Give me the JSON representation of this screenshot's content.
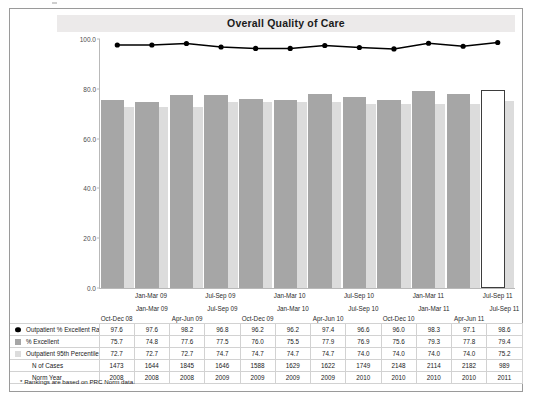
{
  "chart_data": {
    "type": "bar",
    "title": "Overall Quality of Care",
    "xlabel": "",
    "ylabel": "",
    "ylim": [
      0.0,
      100.0
    ],
    "yticks": [
      "0.0",
      "20.0",
      "40.0",
      "60.0",
      "80.0",
      "100.0"
    ],
    "grid": false,
    "legend_position": "table-left",
    "categories": [
      "Oct-Dec 08",
      "Jan-Mar 09",
      "Apr-Jun 09",
      "Jul-Sep 09",
      "Oct-Dec 09",
      "Jan-Mar 10",
      "Apr-Jun 10",
      "Jul-Sep 10",
      "Oct-Dec 10",
      "Jan-Mar 11",
      "Apr-Jun 11",
      "Jul-Sep 11"
    ],
    "series": [
      {
        "name": "Outpatient % Excellent Rank *",
        "type": "line",
        "color": "#000000",
        "values": [
          97.6,
          97.6,
          98.2,
          96.8,
          96.2,
          96.2,
          97.4,
          96.6,
          96.0,
          98.3,
          97.1,
          98.6
        ]
      },
      {
        "name": "% Excellent",
        "type": "bar",
        "color": "#a6a6a6",
        "values": [
          75.7,
          74.8,
          77.6,
          77.5,
          76.0,
          75.5,
          77.9,
          76.9,
          75.6,
          79.3,
          77.8,
          79.4
        ]
      },
      {
        "name": "Outpatient 95th Percentile",
        "type": "bar",
        "color": "#dcdcdc",
        "values": [
          72.7,
          72.7,
          72.7,
          74.7,
          74.7,
          74.7,
          74.7,
          74.0,
          74.0,
          74.0,
          74.0,
          75.2
        ]
      }
    ],
    "highlight_index": 11,
    "footnote": "* Rankings are based on PRC Norm data."
  },
  "chart": {
    "title": "Overall Quality of Care",
    "yticks": [
      "100.0",
      "80.0",
      "60.0",
      "40.0",
      "20.0",
      "0.0"
    ],
    "xlabels": [
      "Oct-Dec 08",
      "Jan-Mar 09",
      "Apr-Jun 09",
      "Jul-Sep 09",
      "Oct-Dec 09",
      "Jan-Mar 10",
      "Apr-Jun 10",
      "Jul-Sep 10",
      "Oct-Dec 10",
      "Jan-Mar 11",
      "Apr-Jun 11",
      "Jul-Sep 11"
    ]
  },
  "table": {
    "header_upper": [
      "",
      "Jan-Mar 09",
      "",
      "Jul-Sep 09",
      "",
      "Jan-Mar 10",
      "",
      "Jul-Sep 10",
      "",
      "Jan-Mar 11",
      "",
      "Jul-Sep 11"
    ],
    "header_lower": [
      "Oct-Dec 08",
      "",
      "Apr-Jun 09",
      "",
      "Oct-Dec 09",
      "",
      "Apr-Jun 10",
      "",
      "Oct-Dec 10",
      "",
      "Apr-Jun 11",
      ""
    ],
    "rows": [
      {
        "label": "Outpatient % Excellent Rank *",
        "marker": "dot",
        "values": [
          "97.6",
          "97.6",
          "98.2",
          "96.8",
          "96.2",
          "96.2",
          "97.4",
          "96.6",
          "96.0",
          "98.3",
          "97.1",
          "98.6"
        ]
      },
      {
        "label": "% Excellent",
        "marker": "mid",
        "values": [
          "75.7",
          "74.8",
          "77.6",
          "77.5",
          "76.0",
          "75.5",
          "77.9",
          "76.9",
          "75.6",
          "79.3",
          "77.8",
          "79.4"
        ]
      },
      {
        "label": "Outpatient 95th Percentile",
        "marker": "light",
        "values": [
          "72.7",
          "72.7",
          "72.7",
          "74.7",
          "74.7",
          "74.7",
          "74.7",
          "74.0",
          "74.0",
          "74.0",
          "74.0",
          "75.2"
        ]
      },
      {
        "label": "N of Cases",
        "marker": "none",
        "values": [
          "1473",
          "1644",
          "1845",
          "1646",
          "1588",
          "1629",
          "1622",
          "1749",
          "2148",
          "2114",
          "2182",
          "989"
        ]
      },
      {
        "label": "Norm Year",
        "marker": "none",
        "values": [
          "2008",
          "2008",
          "2008",
          "2009",
          "2009",
          "2009",
          "2009",
          "2010",
          "2010",
          "2010",
          "2010",
          "2011"
        ]
      }
    ],
    "footnote": "* Rankings are based on PRC Norm data."
  }
}
